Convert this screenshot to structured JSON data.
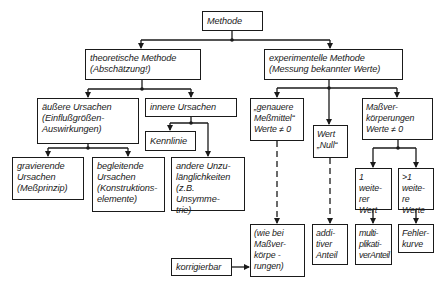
{
  "diagram": {
    "title": "Methode",
    "nodes": {
      "root": {
        "label": "Methode"
      },
      "theoretical": {
        "label": "theoretische Methode\n(Abschätzung!)"
      },
      "experimental": {
        "label": "experimentelle Methode\n(Messung bekannter Werte)"
      },
      "external_causes": {
        "label": "äußere Ursachen\n(Einflußgrößen-\nAuswirkungen)"
      },
      "internal_causes": {
        "label": "innere Ursachen"
      },
      "characteristic": {
        "label": "Kennlinie"
      },
      "serious_causes": {
        "label": "gravierende\nUrsachen\n(Meßprinzip)"
      },
      "accompanying_causes": {
        "label": "begleitende\nUrsachen\n(Konstruktions-\nelemente)"
      },
      "other_deficiencies": {
        "label": "andere Unzu-\nlänglichkeiten\n(z.B. Unsymme-\ntrie)"
      },
      "accurate_instruments": {
        "label": "„genauere\nMeßmittel“\nWerte ≠ 0"
      },
      "value_zero": {
        "label": "Wert\n„Null“"
      },
      "standards": {
        "label": "Maßver-\nkörperungen\nWerte ≠ 0"
      },
      "one_more_value": {
        "label": "1 weite-\nrer\nWert"
      },
      "more_values": {
        "label": ">1 weite-\nre\nWerte"
      },
      "as_standards": {
        "label": "(wie bei\nMaßver-\nkörpe -\nrungen)"
      },
      "additive": {
        "label": "addi-\ntiver\nAnteil"
      },
      "multiplicative": {
        "label": "multi-\nplikati-\nverAnteil"
      },
      "error_curve": {
        "label": "Fehler-\nkurve"
      },
      "correctable": {
        "label": "korrigierbar"
      }
    },
    "edges": [
      {
        "from": "root",
        "to": "theoretical",
        "style": "solid"
      },
      {
        "from": "root",
        "to": "experimental",
        "style": "solid"
      },
      {
        "from": "theoretical",
        "to": "external_causes",
        "style": "solid"
      },
      {
        "from": "theoretical",
        "to": "internal_causes",
        "style": "solid"
      },
      {
        "from": "internal_causes",
        "to": "characteristic",
        "style": "solid"
      },
      {
        "from": "internal_causes",
        "to": "other_deficiencies",
        "style": "solid"
      },
      {
        "from": "external_causes",
        "to": "serious_causes",
        "style": "solid"
      },
      {
        "from": "external_causes",
        "to": "accompanying_causes",
        "style": "solid"
      },
      {
        "from": "experimental",
        "to": "accurate_instruments",
        "style": "solid"
      },
      {
        "from": "experimental",
        "to": "value_zero",
        "style": "solid"
      },
      {
        "from": "experimental",
        "to": "standards",
        "style": "solid"
      },
      {
        "from": "standards",
        "to": "one_more_value",
        "style": "solid"
      },
      {
        "from": "standards",
        "to": "more_values",
        "style": "solid"
      },
      {
        "from": "accurate_instruments",
        "to": "as_standards",
        "style": "dashed"
      },
      {
        "from": "value_zero",
        "to": "additive",
        "style": "dashed"
      },
      {
        "from": "one_more_value",
        "to": "multiplicative",
        "style": "solid"
      },
      {
        "from": "more_values",
        "to": "error_curve",
        "style": "solid"
      },
      {
        "from": "correctable",
        "to": "as_standards",
        "style": "solid"
      }
    ]
  }
}
